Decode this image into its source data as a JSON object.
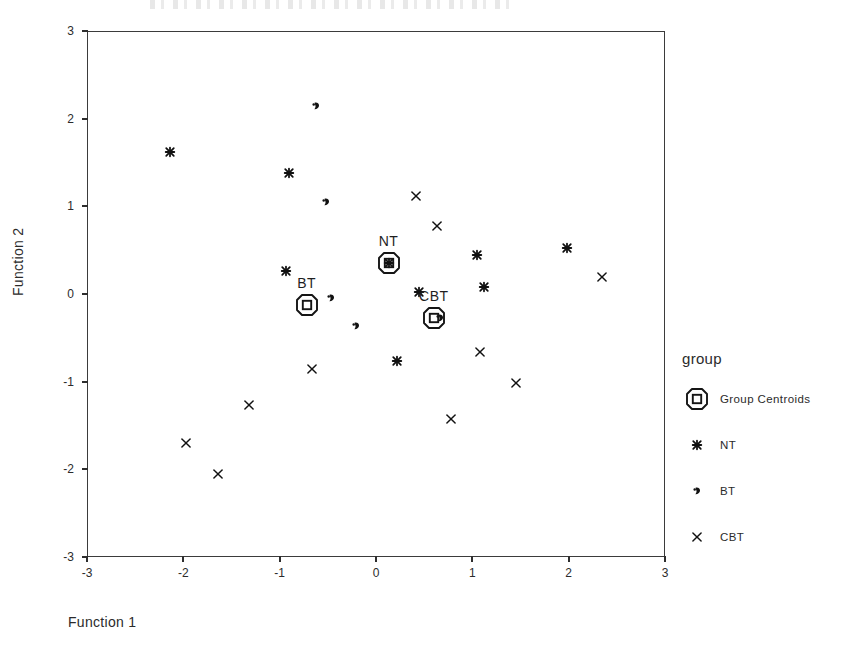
{
  "chart_data": {
    "type": "scatter",
    "title": "",
    "xlabel": "Function 1",
    "ylabel": "Function 2",
    "xlim": [
      -3,
      3
    ],
    "ylim": [
      -3,
      3
    ],
    "xticks": [
      "-3",
      "-2",
      "-1",
      "0",
      "1",
      "2",
      "3"
    ],
    "xtick_values": [
      -3,
      -2,
      -1,
      0,
      1,
      2,
      3
    ],
    "yticks": [
      "-3",
      "-2",
      "-1",
      "0",
      "1",
      "2",
      "3"
    ],
    "ytick_values": [
      -3,
      -2,
      -1,
      0,
      1,
      2,
      3
    ],
    "grid": false,
    "legend_position": "right",
    "legend_title": "group",
    "series": [
      {
        "name": "NT",
        "marker": "nt-star-marker",
        "points": [
          [
            -2.14,
            1.62
          ],
          [
            -0.9,
            1.38
          ],
          [
            -0.93,
            0.26
          ],
          [
            0.13,
            0.35
          ],
          [
            0.45,
            0.02
          ],
          [
            1.05,
            0.44
          ],
          [
            1.12,
            0.08
          ],
          [
            1.98,
            0.52
          ],
          [
            0.22,
            -0.76
          ]
        ]
      },
      {
        "name": "BT",
        "marker": "bt-dot-marker",
        "points": [
          [
            -0.62,
            2.14
          ],
          [
            -0.52,
            1.05
          ],
          [
            -0.47,
            -0.05
          ],
          [
            -0.21,
            -0.37
          ],
          [
            0.66,
            -0.27
          ]
        ]
      },
      {
        "name": "CBT",
        "marker": "cbt-x-marker",
        "points": [
          [
            0.42,
            1.12
          ],
          [
            0.63,
            0.77
          ],
          [
            2.35,
            0.19
          ],
          [
            -0.66,
            -0.86
          ],
          [
            1.08,
            -0.66
          ],
          [
            1.45,
            -1.02
          ],
          [
            -1.32,
            -1.27
          ],
          [
            0.78,
            -1.43
          ],
          [
            -1.97,
            -1.7
          ],
          [
            -1.64,
            -2.05
          ]
        ]
      }
    ],
    "centroids": [
      {
        "label": "NT",
        "x": 0.13,
        "y": 0.35
      },
      {
        "label": "BT",
        "x": -0.72,
        "y": -0.13
      },
      {
        "label": "CBT",
        "x": 0.6,
        "y": -0.27
      }
    ],
    "legend_entries": [
      {
        "label": "Group Centroids",
        "marker": "centroid-marker"
      },
      {
        "label": "NT",
        "marker": "nt-star-marker"
      },
      {
        "label": "BT",
        "marker": "bt-dot-marker"
      },
      {
        "label": "CBT",
        "marker": "cbt-x-marker"
      }
    ],
    "colors": {
      "axis": "#3b3b3b",
      "marker": "#111111",
      "text": "#2b2b2b",
      "background": "#ffffff"
    }
  }
}
